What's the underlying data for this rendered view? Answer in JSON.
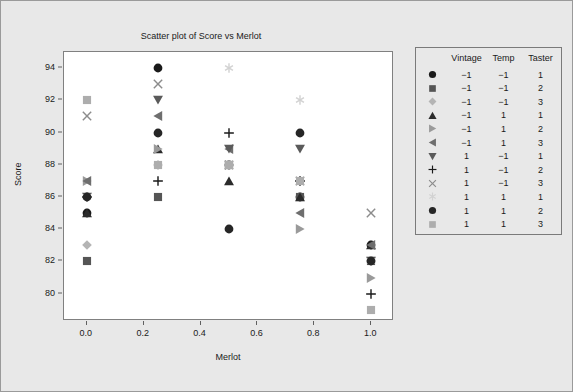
{
  "chart_data": {
    "type": "scatter",
    "title": "Scatter plot of Score vs Merlot",
    "xlabel": "Merlot",
    "ylabel": "Score",
    "xlim": [
      -0.08,
      1.08
    ],
    "ylim": [
      78.3,
      95.0
    ],
    "xticks": [
      "0.0",
      "0.2",
      "0.4",
      "0.6",
      "0.8",
      "1.0"
    ],
    "xtick_values": [
      0.0,
      0.2,
      0.4,
      0.6,
      0.8,
      1.0
    ],
    "yticks": [
      "80",
      "82",
      "84",
      "86",
      "88",
      "90",
      "92",
      "94"
    ],
    "ytick_values": [
      80,
      82,
      84,
      86,
      88,
      90,
      92,
      94
    ],
    "grid": false,
    "legend_position": "right-outside",
    "series": [
      {
        "name": "g1",
        "marker": "circle",
        "color": "#1a1a1a",
        "vintage": "−1",
        "temp": "−1",
        "taster": "1",
        "points": [
          [
            0.0,
            85
          ],
          [
            0.25,
            94
          ],
          [
            0.5,
            88
          ],
          [
            0.75,
            86
          ],
          [
            1.0,
            83
          ]
        ]
      },
      {
        "name": "g2",
        "marker": "square",
        "color": "#555555",
        "vintage": "−1",
        "temp": "−1",
        "taster": "2",
        "points": [
          [
            0.0,
            82
          ],
          [
            0.25,
            86
          ],
          [
            0.5,
            88
          ],
          [
            0.75,
            86
          ],
          [
            1.0,
            82
          ]
        ]
      },
      {
        "name": "g3",
        "marker": "diamond",
        "color": "#b4b4b4",
        "vintage": "−1",
        "temp": "−1",
        "taster": "3",
        "points": [
          [
            0.0,
            83
          ],
          [
            0.25,
            88
          ],
          [
            0.5,
            88
          ],
          [
            0.75,
            87
          ],
          [
            1.0,
            82
          ]
        ]
      },
      {
        "name": "g4",
        "marker": "triangle-up",
        "color": "#2b2b2b",
        "vintage": "−1",
        "temp": "1",
        "taster": "1",
        "points": [
          [
            0.0,
            85
          ],
          [
            0.25,
            89
          ],
          [
            0.5,
            87
          ],
          [
            0.75,
            86
          ],
          [
            1.0,
            83
          ]
        ]
      },
      {
        "name": "g5",
        "marker": "triangle-right",
        "color": "#9a9a9a",
        "vintage": "−1",
        "temp": "1",
        "taster": "2",
        "points": [
          [
            0.0,
            87
          ],
          [
            0.25,
            89
          ],
          [
            0.5,
            88
          ],
          [
            0.75,
            84
          ],
          [
            1.0,
            81
          ]
        ]
      },
      {
        "name": "g6",
        "marker": "triangle-left",
        "color": "#6e6e6e",
        "vintage": "−1",
        "temp": "1",
        "taster": "3",
        "points": [
          [
            0.0,
            87
          ],
          [
            0.25,
            91
          ],
          [
            0.5,
            89
          ],
          [
            0.75,
            85
          ],
          [
            1.0,
            83
          ]
        ]
      },
      {
        "name": "g7",
        "marker": "triangle-down",
        "color": "#5a5a5a",
        "vintage": "1",
        "temp": "−1",
        "taster": "1",
        "points": [
          [
            0.0,
            86
          ],
          [
            0.25,
            92
          ],
          [
            0.5,
            89
          ],
          [
            0.75,
            89
          ],
          [
            1.0,
            82
          ]
        ]
      },
      {
        "name": "g8",
        "marker": "plus",
        "color": "#1a1a1a",
        "vintage": "1",
        "temp": "−1",
        "taster": "2",
        "points": [
          [
            0.0,
            86
          ],
          [
            0.25,
            87
          ],
          [
            0.5,
            90
          ],
          [
            0.75,
            87
          ],
          [
            1.0,
            80
          ]
        ]
      },
      {
        "name": "g9",
        "marker": "x",
        "color": "#8c8c8c",
        "vintage": "1",
        "temp": "−1",
        "taster": "3",
        "points": [
          [
            0.0,
            91
          ],
          [
            0.25,
            93
          ],
          [
            0.5,
            88
          ],
          [
            0.75,
            87
          ],
          [
            1.0,
            85
          ]
        ]
      },
      {
        "name": "g10",
        "marker": "asterisk",
        "color": "#d2d2d2",
        "vintage": "1",
        "temp": "1",
        "taster": "1",
        "points": [
          [
            0.0,
            86
          ],
          [
            0.25,
            88
          ],
          [
            0.5,
            94
          ],
          [
            0.75,
            92
          ],
          [
            1.0,
            82
          ]
        ]
      },
      {
        "name": "g11",
        "marker": "circle",
        "color": "#262626",
        "vintage": "1",
        "temp": "1",
        "taster": "2",
        "points": [
          [
            0.0,
            86
          ],
          [
            0.25,
            90
          ],
          [
            0.5,
            84
          ],
          [
            0.75,
            90
          ],
          [
            1.0,
            82
          ]
        ]
      },
      {
        "name": "g12",
        "marker": "square",
        "color": "#adadad",
        "vintage": "1",
        "temp": "1",
        "taster": "3",
        "points": [
          [
            0.0,
            92
          ],
          [
            0.25,
            88
          ],
          [
            0.5,
            88
          ],
          [
            0.75,
            87
          ],
          [
            1.0,
            79
          ]
        ]
      }
    ]
  },
  "legend": {
    "headers": [
      "Vintage",
      "Temp",
      "Taster"
    ]
  }
}
